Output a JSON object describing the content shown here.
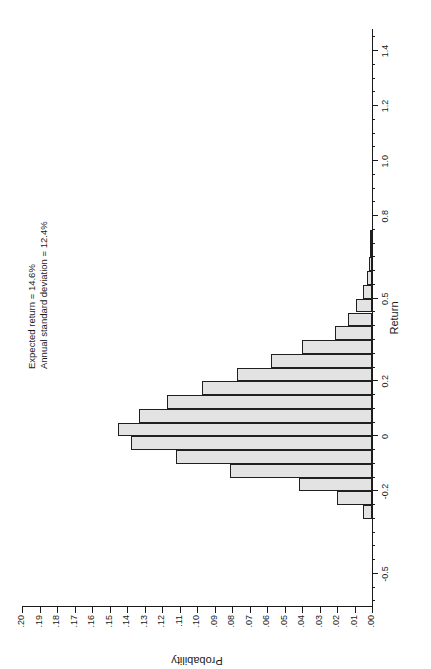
{
  "figure": {
    "orientation": "rotated-90-ccw",
    "background_color": "#ffffff",
    "bar_fill_color": "#e3e3e3",
    "bar_border_color": "#1f1f1f",
    "annotation": {
      "line1": "Expected return = 14.6%",
      "line2": "Annual standard deviation = 12.4%"
    },
    "caption_partial": "",
    "x_title": "Return",
    "y_title": "Probability"
  },
  "chart_data": {
    "type": "bar",
    "title": "",
    "subtitle": "",
    "xlabel": "Return",
    "ylabel": "Probability",
    "xlim": [
      -0.62,
      1.48
    ],
    "ylim": [
      0.0,
      0.2
    ],
    "grid": false,
    "legend": null,
    "x_tick_labels": [
      "-0.5",
      "-0.2",
      "0",
      "0.2",
      "0.5",
      "0.8",
      "1.0",
      "1.2",
      "1.4"
    ],
    "x_tick_values": [
      -0.5,
      -0.2,
      0,
      0.2,
      0.5,
      0.8,
      1.0,
      1.2,
      1.4
    ],
    "x_minor_tick_step": 0.05,
    "y_tick_labels": [
      ".00",
      ".01",
      ".02",
      ".03",
      ".04",
      ".05",
      ".06",
      ".07",
      ".08",
      ".09",
      ".10",
      ".11",
      ".12",
      ".13",
      ".14",
      ".15",
      ".16",
      ".17",
      ".18",
      ".19",
      ".20"
    ],
    "y_tick_values": [
      0.0,
      0.01,
      0.02,
      0.03,
      0.04,
      0.05,
      0.06,
      0.07,
      0.08,
      0.09,
      0.1,
      0.11,
      0.12,
      0.13,
      0.14,
      0.15,
      0.16,
      0.17,
      0.18,
      0.19,
      0.2
    ],
    "bin_width": 0.05,
    "bin_left_edges": [
      -0.3,
      -0.25,
      -0.2,
      -0.15,
      -0.1,
      -0.05,
      0.0,
      0.05,
      0.1,
      0.15,
      0.2,
      0.25,
      0.3,
      0.35,
      0.4,
      0.45,
      0.5,
      0.55,
      0.6,
      0.65,
      0.7
    ],
    "categories": [
      "-0.30",
      "-0.25",
      "-0.20",
      "-0.15",
      "-0.10",
      "-0.05",
      "0.00",
      "0.05",
      "0.10",
      "0.15",
      "0.20",
      "0.25",
      "0.30",
      "0.35",
      "0.40",
      "0.45",
      "0.50",
      "0.55",
      "0.60",
      "0.65",
      "0.70"
    ],
    "values": [
      0.005,
      0.02,
      0.042,
      0.081,
      0.112,
      0.138,
      0.145,
      0.133,
      0.117,
      0.097,
      0.077,
      0.058,
      0.04,
      0.021,
      0.014,
      0.009,
      0.005,
      0.003,
      0.002,
      0.001,
      0.001
    ],
    "annotations": [
      "Expected return = 14.6%",
      "Annual standard deviation = 12.4%"
    ]
  }
}
